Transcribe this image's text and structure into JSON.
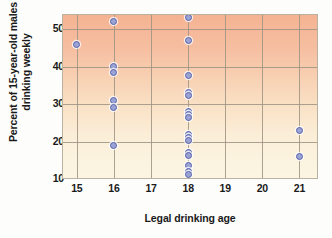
{
  "chart_data": {
    "type": "scatter",
    "title": "",
    "xlabel": "Legal drinking age",
    "ylabel_line1": "Percent of 15-year-old males",
    "ylabel_line2": "drinking weekly",
    "xlim": [
      14.6,
      21.5
    ],
    "ylim": [
      10,
      54
    ],
    "xticks": [
      15,
      16,
      17,
      18,
      19,
      20,
      21
    ],
    "yticks": [
      10,
      20,
      30,
      40,
      50
    ],
    "xtick_labels": [
      "15",
      "16",
      "17",
      "18",
      "19",
      "20",
      "21"
    ],
    "ytick_labels": [
      "10",
      "20",
      "30",
      "40",
      "50"
    ],
    "grid": "both",
    "legend": "none",
    "marker_color": "#9aa3d4",
    "marker_edge_color": "#5862a8",
    "points": [
      {
        "x": 15,
        "y": 46
      },
      {
        "x": 16,
        "y": 52
      },
      {
        "x": 16,
        "y": 40
      },
      {
        "x": 16,
        "y": 38.5
      },
      {
        "x": 16,
        "y": 31
      },
      {
        "x": 16,
        "y": 29
      },
      {
        "x": 16,
        "y": 19
      },
      {
        "x": 18,
        "y": 53
      },
      {
        "x": 18,
        "y": 47
      },
      {
        "x": 18,
        "y": 37.5
      },
      {
        "x": 18,
        "y": 33
      },
      {
        "x": 18,
        "y": 32.3
      },
      {
        "x": 18,
        "y": 28
      },
      {
        "x": 18,
        "y": 27.3
      },
      {
        "x": 18,
        "y": 26.4
      },
      {
        "x": 18,
        "y": 22
      },
      {
        "x": 18,
        "y": 21
      },
      {
        "x": 18,
        "y": 20.4
      },
      {
        "x": 18,
        "y": 17
      },
      {
        "x": 18,
        "y": 16.4
      },
      {
        "x": 18,
        "y": 13.5
      },
      {
        "x": 18,
        "y": 12
      },
      {
        "x": 18,
        "y": 11.2
      },
      {
        "x": 21,
        "y": 23
      },
      {
        "x": 21,
        "y": 16
      }
    ]
  }
}
